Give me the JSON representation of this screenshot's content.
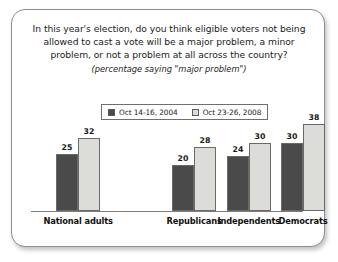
{
  "card": {
    "border_color": "#8e8e8e",
    "background": "#ffffff"
  },
  "title": {
    "line1": "In this year's election, do you think eligible voters not being",
    "line2": "allowed to cast a vote will be a major problem, a minor",
    "line3": "problem, or not a problem at all across the country?",
    "subtitle": "(percentage saying \"major problem\")"
  },
  "legend": {
    "items": [
      {
        "label": "Oct 14-16, 2004",
        "color": "#4a4a4a"
      },
      {
        "label": "Oct 23-26, 2008",
        "color": "#dcdcd8"
      }
    ]
  },
  "chart_data": {
    "type": "bar",
    "title": "In this year's election, do you think eligible voters not being allowed to cast a vote will be a major problem, a minor problem, or not a problem at all across the country?",
    "subtitle": "(percentage saying \"major problem\")",
    "xlabel": "",
    "ylabel": "",
    "ylim": [
      0,
      45
    ],
    "grid": false,
    "legend_position": "top-center",
    "categories": [
      "National adults",
      "Republicans",
      "Independents",
      "Democrats"
    ],
    "series": [
      {
        "name": "Oct 14-16, 2004",
        "color": "#4a4a4a",
        "values": [
          25,
          20,
          24,
          30
        ]
      },
      {
        "name": "Oct 23-26, 2008",
        "color": "#dcdcd8",
        "values": [
          32,
          28,
          30,
          38
        ]
      }
    ]
  },
  "layout": {
    "group_centers": [
      66,
      182,
      237,
      291
    ],
    "bar_width": 22,
    "baseline_y": 201,
    "px_per_unit": 2.28
  }
}
